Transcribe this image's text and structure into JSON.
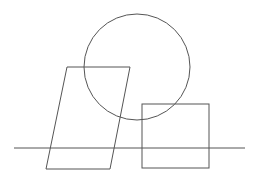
{
  "diagram": {
    "width": 256,
    "height": 178,
    "background": "#ffffff",
    "stroke_color": "#555555",
    "stroke_width": 1,
    "shapes": [
      {
        "type": "line",
        "name": "baseline",
        "x1": 14,
        "y1": 148,
        "x2": 245,
        "y2": 148
      },
      {
        "type": "circle",
        "name": "circle",
        "cx": 137,
        "cy": 67,
        "r": 53
      },
      {
        "type": "polygon",
        "name": "parallelogram",
        "points": "67,67 130,67 110,169 46,169"
      },
      {
        "type": "rect",
        "name": "square",
        "x": 142,
        "y": 104,
        "width": 67,
        "height": 64
      }
    ]
  }
}
